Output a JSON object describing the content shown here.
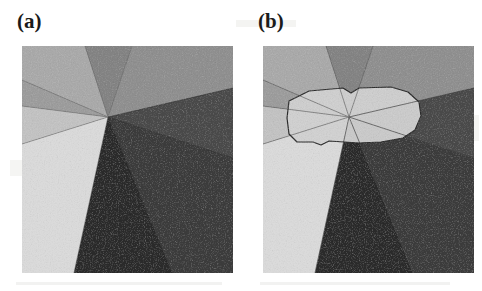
{
  "figure": {
    "type": "two-panel-grayscale-segmentation-figure",
    "width": 482,
    "height": 291,
    "background_color": "#ffffff",
    "panels": [
      {
        "id": "a",
        "label": "(a)",
        "description": "Grayscale polycrystalline grain image with wedge-shaped regions radiating from a central triple-junction vertex",
        "image_box": {
          "x": 22,
          "y": 46,
          "width": 211,
          "height": 227
        },
        "center_vertex": {
          "x": 86,
          "y": 71
        },
        "overlay_outline": false,
        "regions": [
          {
            "name": "top-left-light-gray-wedge",
            "fill": "#a9a9a9"
          },
          {
            "name": "top-mid-medium-gray-wedge",
            "fill": "#838383"
          },
          {
            "name": "top-right-gray-wedge",
            "fill": "#8f8f8f"
          },
          {
            "name": "right-dark-gray-wedge",
            "fill": "#4a4a4a"
          },
          {
            "name": "right-lower-dark-wedge",
            "fill": "#3c3c3c"
          },
          {
            "name": "bottom-darkest-wedge",
            "fill": "#2a2a2a"
          },
          {
            "name": "bottom-left-very-light-wedge",
            "fill": "#d9d9d9"
          },
          {
            "name": "left-light-wedge",
            "fill": "#c2c2c2"
          },
          {
            "name": "left-mid-gray-wedge",
            "fill": "#9c9c9c"
          }
        ]
      },
      {
        "id": "b",
        "label": "(b)",
        "description": "Same grain image as panel (a) with a traced closed polygon outline delineating a central light grain region around the vertex",
        "image_box": {
          "x": 248,
          "y": 46,
          "width": 211,
          "height": 227
        },
        "center_vertex": {
          "x": 86,
          "y": 71
        },
        "overlay_outline": true,
        "outline_color": "#2b2b2b",
        "outline_width": 1.2,
        "regions": [
          {
            "name": "top-left-light-gray-wedge",
            "fill": "#a9a9a9"
          },
          {
            "name": "top-mid-medium-gray-wedge",
            "fill": "#838383"
          },
          {
            "name": "top-right-gray-wedge",
            "fill": "#8f8f8f"
          },
          {
            "name": "right-dark-gray-wedge",
            "fill": "#4a4a4a"
          },
          {
            "name": "right-lower-dark-wedge",
            "fill": "#3c3c3c"
          },
          {
            "name": "bottom-darkest-wedge",
            "fill": "#2a2a2a"
          },
          {
            "name": "bottom-left-very-light-wedge",
            "fill": "#d9d9d9"
          },
          {
            "name": "left-light-wedge",
            "fill": "#c2c2c2"
          },
          {
            "name": "left-mid-gray-wedge",
            "fill": "#9c9c9c"
          },
          {
            "name": "traced-central-grain-polygon",
            "fill": "#cfcfcf"
          }
        ]
      }
    ]
  },
  "palette": {
    "page_background": "#ffffff",
    "label_text": "#1a1a1a",
    "outline": "#2b2b2b",
    "shade_lightest": "#d9d9d9",
    "shade_darkest": "#2a2a2a"
  }
}
